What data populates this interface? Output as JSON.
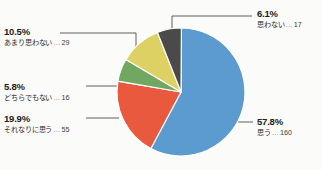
{
  "chart_data": {
    "type": "pie",
    "title": "",
    "subtitle": "",
    "xlabel": "",
    "ylabel": "",
    "legend_position": "none",
    "grid": false,
    "total": 277,
    "categories": [
      "思う",
      "それなりに思う",
      "どちらでもない",
      "あまり思わない",
      "思わない"
    ],
    "values": [
      160,
      55,
      16,
      29,
      17
    ],
    "percentages": [
      57.8,
      19.9,
      5.8,
      10.5,
      6.1
    ],
    "colors": [
      "#5b9bd0",
      "#e8593e",
      "#70a862",
      "#ddd163",
      "#4a4a4a"
    ],
    "slices": [
      {
        "label": "思う",
        "percent_text": "57.8%",
        "value": 160,
        "value_text": "160",
        "color": "#5b9bd0"
      },
      {
        "label": "それなりに思う",
        "percent_text": "19.9%",
        "value": 55,
        "value_text": "55",
        "color": "#e8593e"
      },
      {
        "label": "どちらでもない",
        "percent_text": "5.8%",
        "value": 16,
        "value_text": "16",
        "color": "#70a862"
      },
      {
        "label": "あまり思わない",
        "percent_text": "10.5%",
        "value": 29,
        "value_text": "29",
        "color": "#ddd163"
      },
      {
        "label": "思わない",
        "percent_text": "6.1%",
        "value": 17,
        "value_text": "17",
        "color": "#4a4a4a"
      }
    ],
    "separator": "…"
  },
  "callouts": {
    "amari": {
      "percent": "10.5%",
      "category": "あまり思わない",
      "sep": "…",
      "count": "29"
    },
    "dochira": {
      "percent": "5.8%",
      "category": "どちらでもない",
      "sep": "…",
      "count": "16"
    },
    "sorenari": {
      "percent": "19.9%",
      "category": "それなりに思う",
      "sep": "…",
      "count": "55"
    },
    "omowanai": {
      "percent": "6.1%",
      "category": "思わない",
      "sep": "…",
      "count": "17"
    },
    "omou": {
      "percent": "57.8%",
      "category": "思う",
      "sep": "…",
      "count": "160"
    }
  }
}
